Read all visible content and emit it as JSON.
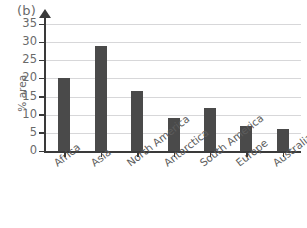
{
  "panel": {
    "label": "(b)"
  },
  "chart_data": {
    "type": "bar",
    "title": "",
    "subtitle": "",
    "xlabel": "",
    "ylabel": "% area",
    "categories": [
      "Africa",
      "Asia",
      "North America",
      "Antarctica",
      "South America",
      "Europe",
      "Australia"
    ],
    "values": [
      20,
      29,
      16.5,
      9,
      12,
      7,
      6
    ],
    "series": [
      {
        "name": "% area",
        "values": [
          20,
          29,
          16.5,
          9,
          12,
          7,
          6
        ]
      }
    ],
    "ylim": [
      0,
      35
    ],
    "yticks": [
      0,
      5,
      10,
      15,
      20,
      25,
      30,
      35
    ],
    "ytick_labels": [
      "0",
      "5",
      "10",
      "15",
      "20",
      "25",
      "30",
      "35"
    ],
    "grid": true,
    "grid_axis": "y",
    "legend": false,
    "legend_position": "none",
    "bar_color": "#4a4a4a",
    "gridline_color": "#d7d7d9",
    "axis_color": "#3a3a3a",
    "text_color": "#6a6a6a",
    "background_color": "#ffffff",
    "annotations": []
  }
}
